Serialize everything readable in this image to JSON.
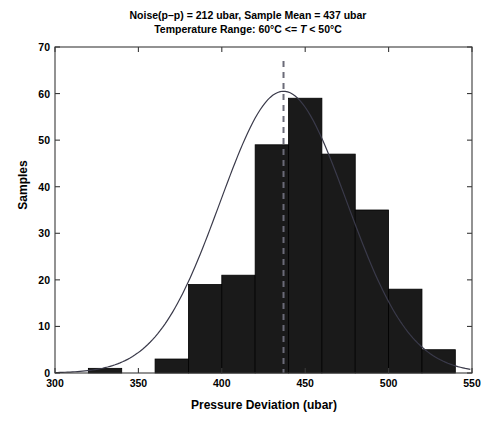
{
  "chart_data": {
    "type": "bar",
    "title": "Noise(p–p) = 212 ubar, Sample Mean = 437 ubar",
    "subtitle_prefix": "Temperature Range: 60°C <= ",
    "subtitle_italic": "T",
    "subtitle_suffix": " < 50°C",
    "subtitle": "Temperature Range: 60°C <= T < 50°C",
    "xlabel": "Pressure Deviation (ubar)",
    "ylabel": "Samples",
    "xlim": [
      300,
      550
    ],
    "ylim": [
      0,
      70
    ],
    "xticks": [
      300,
      350,
      400,
      450,
      500,
      550
    ],
    "yticks": [
      0,
      10,
      20,
      30,
      40,
      50,
      60,
      70
    ],
    "grid": false,
    "legend": "none",
    "bin_width": 20,
    "bin_edges": [
      320,
      340,
      360,
      380,
      400,
      420,
      440,
      460,
      480,
      500,
      520,
      540
    ],
    "bin_centers": [
      330,
      350,
      370,
      390,
      410,
      430,
      450,
      470,
      490,
      510,
      530
    ],
    "values": [
      1,
      0,
      3,
      19,
      21,
      49,
      59,
      47,
      35,
      18,
      5
    ],
    "bar_color": "#1a1a1a",
    "bar_edge_color": "#000000",
    "overlay": {
      "type": "gaussian-fit",
      "name": "Normal fit curve",
      "color": "#3a3a4a",
      "mean": 437,
      "sigma": 38,
      "peak": 60.5
    },
    "mean_line": {
      "name": "Sample mean marker",
      "value": 437,
      "style": "dashed",
      "color": "#6b6b78"
    }
  },
  "axis": {
    "xtick_labels": [
      "300",
      "350",
      "400",
      "450",
      "500",
      "550"
    ],
    "ytick_labels": [
      "0",
      "10",
      "20",
      "30",
      "40",
      "50",
      "60",
      "70"
    ]
  }
}
